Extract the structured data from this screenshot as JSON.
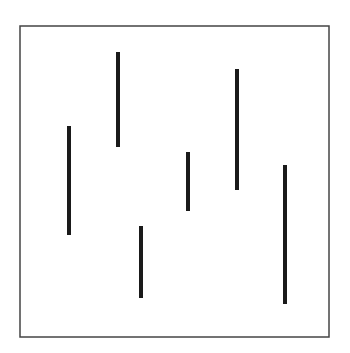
{
  "figure": {
    "background": "#ffffff",
    "frame": {
      "x": 20,
      "y": 26,
      "width": 309,
      "height": 311,
      "stroke": "#444444",
      "stroke_width": 1.5
    },
    "line_color": "#1a1a1a",
    "line_width": 4,
    "lines": [
      {
        "x": 69,
        "y1": 126,
        "y2": 235
      },
      {
        "x": 118,
        "y1": 52,
        "y2": 147
      },
      {
        "x": 141,
        "y1": 226,
        "y2": 298
      },
      {
        "x": 188,
        "y1": 152,
        "y2": 211
      },
      {
        "x": 237,
        "y1": 69,
        "y2": 190
      },
      {
        "x": 285,
        "y1": 165,
        "y2": 304
      }
    ]
  }
}
